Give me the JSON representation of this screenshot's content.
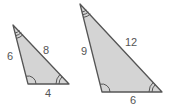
{
  "diagram": {
    "colors": {
      "fill": "#d4d4d4",
      "stroke": "#555555",
      "text": "#555555"
    },
    "triangles": [
      {
        "name": "small",
        "sides": {
          "left": "6",
          "hypotenuse": "8",
          "base": "4"
        },
        "angle_marks": {
          "top": "triple-arc",
          "bottom_left": "single-arc",
          "bottom_right": "double-arc"
        }
      },
      {
        "name": "large",
        "sides": {
          "left": "9",
          "hypotenuse": "12",
          "base": "6"
        },
        "angle_marks": {
          "top": "triple-arc",
          "bottom_left": "single-arc",
          "bottom_right": "double-arc"
        }
      }
    ]
  }
}
